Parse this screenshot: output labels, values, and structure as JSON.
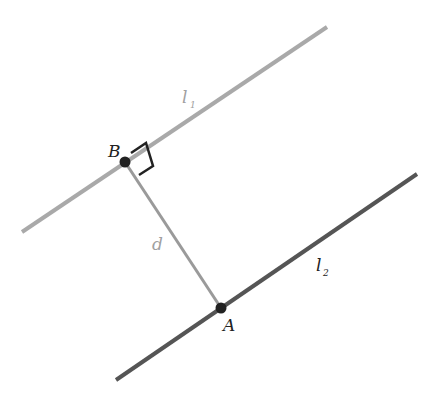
{
  "diagram": {
    "colors": {
      "background": "#ffffff",
      "line_l1": "#a9a9a9",
      "line_l2": "#555555",
      "segment_d": "#9a9a9a",
      "point": "#222222",
      "right_angle": "#222222",
      "label_dark": "#222222",
      "label_light": "#a0a0a0"
    },
    "lines": [
      {
        "id": "l1",
        "label": "l",
        "subscript": "1",
        "x1": 22,
        "y1": 232,
        "x2": 327,
        "y2": 27,
        "label_x": 182,
        "label_y": 103,
        "sub_x": 190,
        "sub_y": 108
      },
      {
        "id": "l2",
        "label": "l",
        "subscript": "2",
        "x1": 116,
        "y1": 380,
        "x2": 417,
        "y2": 174,
        "label_x": 316,
        "label_y": 271,
        "sub_x": 323,
        "sub_y": 276
      }
    ],
    "segment": {
      "id": "d",
      "label": "d",
      "x1": 125,
      "y1": 162,
      "x2": 221,
      "y2": 308,
      "label_x": 152,
      "label_y": 250
    },
    "points": [
      {
        "id": "B",
        "label": "B",
        "x": 125,
        "y": 162,
        "label_x": 108,
        "label_y": 157
      },
      {
        "id": "A",
        "label": "A",
        "x": 221,
        "y": 308,
        "label_x": 223,
        "label_y": 331
      }
    ],
    "right_angle_marker": {
      "at": "B",
      "points": "131,153 146,143 153,166 139,175"
    }
  }
}
